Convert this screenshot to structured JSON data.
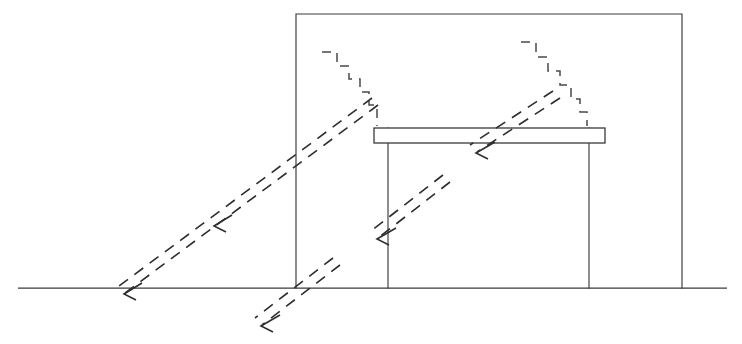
{
  "diagram": {
    "type": "architectural-section-line-drawing",
    "canvas": {
      "width": 742,
      "height": 344,
      "background": "#ffffff"
    },
    "colors": {
      "line": "#3a3a3a",
      "ray": "#2e2e2e",
      "zigzag": "#4a4a4a",
      "fill": "#ffffff"
    },
    "ground": {
      "label": "ground-line",
      "x1": 18,
      "y1": 288,
      "x2": 727,
      "y2": 288
    },
    "building": {
      "label": "building-section-outline",
      "left_wall_x": 296,
      "right_wall_x": 682,
      "roof_y": 14,
      "base_y": 288,
      "open_bottom": true
    },
    "shelf": {
      "label": "light-shelf",
      "x": 374,
      "y": 128,
      "width": 231,
      "height": 15
    },
    "columns": [
      {
        "label": "left-column",
        "x": 388,
        "y_top": 128,
        "y_bottom": 288
      },
      {
        "label": "right-column",
        "x": 589,
        "y_top": 128,
        "y_bottom": 288
      }
    ],
    "rays": [
      {
        "label": "incoming-ray-exterior",
        "from_x": 378,
        "from_y": 105,
        "to_x": 125,
        "to_y": 293,
        "direction": "down-left",
        "style": "dashed-double",
        "arrow_at": "end"
      },
      {
        "label": "reflected-ray-to-floor-outer",
        "from_x": 340,
        "from_y": 265,
        "to_x": 262,
        "to_y": 325,
        "direction": "down-left",
        "style": "dashed-double",
        "arrow_at": "end"
      },
      {
        "label": "interior-bounce-ray",
        "from_x": 450,
        "from_y": 182,
        "to_x": 378,
        "to_y": 238,
        "direction": "down-left",
        "style": "dashed-double",
        "arrow_at": "end"
      },
      {
        "label": "under-shelf-ray",
        "from_x": 560,
        "from_y": 98,
        "to_x": 477,
        "to_y": 152,
        "direction": "down-left",
        "style": "dashed-double",
        "arrow_at": "end"
      }
    ],
    "zigzags": [
      {
        "label": "left-stepped-ray-path",
        "start_x": 322,
        "start_y": 52,
        "end_x": 376,
        "end_y": 126,
        "steps": 5,
        "style": "dashed-stepped"
      },
      {
        "label": "right-stepped-ray-path",
        "start_x": 521,
        "start_y": 42,
        "end_x": 586,
        "end_y": 126,
        "steps": 5,
        "style": "dashed-stepped"
      }
    ]
  }
}
